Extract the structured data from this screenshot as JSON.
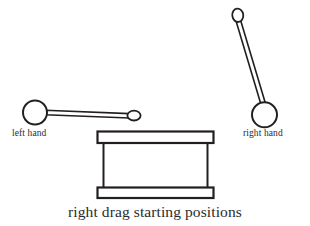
{
  "figure": {
    "caption": "right drag starting positions",
    "background_color": "#ffffff",
    "stroke_color": "#231f20",
    "text_color": "#2b2b2b"
  },
  "labels": {
    "left_hand": "left hand",
    "right_hand": "right hand"
  },
  "objects": {
    "left_stick": {
      "name": "left hand drumstick",
      "hand_circle": {
        "cx": 35,
        "cy": 112.5,
        "r": 12
      },
      "tip_ellipse": {
        "cx": 134,
        "cy": 115.5,
        "rx": 6.5,
        "ry": 4.8
      },
      "shaft": {
        "x1": 46,
        "y1": 112.5,
        "x2": 128,
        "y2": 115.5,
        "width": 4.5
      }
    },
    "right_stick": {
      "name": "right hand drumstick",
      "hand_circle": {
        "cx": 264.5,
        "cy": 114.5,
        "r": 12.5
      },
      "tip_ellipse": {
        "cx": 238,
        "cy": 15.5,
        "rx": 5.4,
        "ry": 6.6
      },
      "shaft": {
        "x1": 239,
        "y1": 22,
        "x2": 262,
        "y2": 103,
        "width": 4.5
      }
    },
    "drum": {
      "name": "drum",
      "top_rim": {
        "x": 97,
        "y": 131,
        "width": 117,
        "height": 12
      },
      "bottom_rim": {
        "x": 97,
        "y": 187,
        "width": 117,
        "height": 11
      },
      "left_side": {
        "x": 103,
        "y1": 143,
        "y2": 187
      },
      "right_side": {
        "x": 208,
        "y1": 143,
        "y2": 187
      }
    }
  }
}
